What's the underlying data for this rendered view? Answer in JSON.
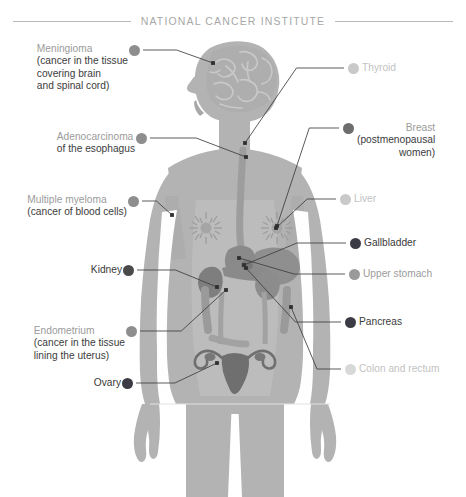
{
  "header": {
    "title": "NATIONAL CANCER INSTITUTE"
  },
  "palette": {
    "background": "#ffffff",
    "body_fill": "#b3b3b3",
    "body_shade": "#a3a3a3",
    "organ_dark": "#8a8a8a",
    "leader_line": "#3d3d3d",
    "rule": "#b9b9b9",
    "dot_darkest": "#3b3b45",
    "dot_dark": "#6d6d6d",
    "dot_medium": "#8e8e8e",
    "dot_light": "#c9c9c9",
    "dot_lightest": "#d8d8d8",
    "text_head": "#9b9b9b",
    "text_sub": "#3c3c3c",
    "text_dim": "#c2c2c2",
    "text_bold": "#3a3a3a"
  },
  "labels_left": [
    {
      "name": "meningioma",
      "head": "Meningioma",
      "sub": [
        "(cancer in the tissue",
        "covering brain",
        "and spinal cord)"
      ],
      "dot": "#8e8e8e",
      "tone": "normal",
      "dot_x": 134,
      "dot_y": 50,
      "text_right": 128,
      "text_top": 43,
      "anchor_x": 213,
      "anchor_y": 63
    },
    {
      "name": "adenocarcinoma-esophagus",
      "head": "Adenocarcinoma",
      "sub": [
        "of the esophagus"
      ],
      "dot": "#8e8e8e",
      "tone": "normal",
      "dot_x": 141,
      "dot_y": 138,
      "text_right": 135,
      "text_top": 131,
      "anchor_x": 246,
      "anchor_y": 157
    },
    {
      "name": "multiple-myeloma",
      "head": "Multiple myeloma",
      "sub": [
        "(cancer of blood cells)"
      ],
      "dot": "#8e8e8e",
      "tone": "normal",
      "dot_x": 133,
      "dot_y": 201,
      "text_right": 127,
      "text_top": 194,
      "anchor_x": 172,
      "anchor_y": 215
    },
    {
      "name": "kidney",
      "head": "Kidney",
      "sub": [],
      "dot": "#4a4a4a",
      "tone": "bold",
      "dot_x": 128,
      "dot_y": 270,
      "text_right": 122,
      "text_top": 264,
      "anchor_x": 217,
      "anchor_y": 287
    },
    {
      "name": "endometrium",
      "head": "Endometrium",
      "sub": [
        "(cancer in the tissue",
        "lining the uterus)"
      ],
      "dot": "#8e8e8e",
      "tone": "normal",
      "dot_x": 131,
      "dot_y": 331,
      "text_right": 125,
      "text_top": 325,
      "anchor_x": 226,
      "anchor_y": 290
    },
    {
      "name": "ovary",
      "head": "Ovary",
      "sub": [],
      "dot": "#3b3b45",
      "tone": "bold",
      "dot_x": 127,
      "dot_y": 383,
      "text_right": 121,
      "text_top": 377,
      "anchor_x": 217,
      "anchor_y": 363
    }
  ],
  "labels_right": [
    {
      "name": "thyroid",
      "head": "Thyroid",
      "sub": [],
      "dot": "#c9c9c9",
      "tone": "dim",
      "dot_x": 353,
      "dot_y": 68,
      "text_left": 362,
      "text_top": 62,
      "anchor_x": 245,
      "anchor_y": 143
    },
    {
      "name": "breast",
      "head": "Breast",
      "sub": [
        "(postmenopausal",
        "women)"
      ],
      "dot": "#6d6d6d",
      "tone": "normal",
      "dot_x": 348,
      "dot_y": 128,
      "text_left": 357,
      "text_top": 122,
      "anchor_x": 277,
      "anchor_y": 226
    },
    {
      "name": "liver",
      "head": "Liver",
      "sub": [],
      "dot": "#c9c9c9",
      "tone": "dim",
      "dot_x": 345,
      "dot_y": 199,
      "text_left": 354,
      "text_top": 193,
      "anchor_x": 276,
      "anchor_y": 228
    },
    {
      "name": "gallbladder",
      "head": "Gallbladder",
      "sub": [],
      "dot": "#3b3b45",
      "tone": "bold",
      "dot_x": 355,
      "dot_y": 243,
      "text_left": 364,
      "text_top": 237,
      "anchor_x": 244,
      "anchor_y": 265
    },
    {
      "name": "upper-stomach",
      "head": "Upper stomach",
      "sub": [],
      "dot": "#9a9a9a",
      "tone": "normal",
      "dot_x": 354,
      "dot_y": 274,
      "text_left": 363,
      "text_top": 268,
      "anchor_x": 239,
      "anchor_y": 258
    },
    {
      "name": "pancreas",
      "head": "Pancreas",
      "sub": [],
      "dot": "#3b3b45",
      "tone": "bold",
      "dot_x": 350,
      "dot_y": 322,
      "text_left": 359,
      "text_top": 316,
      "anchor_x": 246,
      "anchor_y": 268
    },
    {
      "name": "colon-and-rectum",
      "head": "Colon and rectum",
      "sub": [],
      "dot": "#d8d8d8",
      "tone": "dim",
      "dot_x": 350,
      "dot_y": 369,
      "text_left": 359,
      "text_top": 363,
      "anchor_x": 291,
      "anchor_y": 307
    }
  ],
  "figure": {
    "parts": [
      "head-profile",
      "brain",
      "esophagus",
      "breasts",
      "liver",
      "stomach",
      "pancreas",
      "gallbladder",
      "kidneys",
      "colon",
      "uterus",
      "ovaries",
      "arms",
      "legs"
    ]
  }
}
